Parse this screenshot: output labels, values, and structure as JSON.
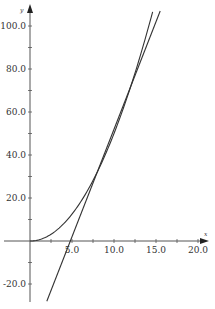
{
  "chart_data": {
    "type": "line",
    "title": "",
    "xlabel": "x",
    "ylabel": "y",
    "xlim": [
      -3.5,
      21.5
    ],
    "ylim": [
      -31,
      110
    ],
    "grid": false,
    "legend": "none",
    "x_ticks": [
      5.0,
      10.0,
      15.0,
      20.0
    ],
    "x_tick_labels": [
      "5.0",
      "10.0",
      "15.0",
      "20.0"
    ],
    "y_ticks": [
      -20.0,
      20.0,
      40.0,
      60.0,
      80.0,
      100.0
    ],
    "y_tick_labels": [
      "-20.0",
      "20.0",
      "40.0",
      "60.0",
      "80.0",
      "100.0"
    ],
    "series": [
      {
        "name": "curve",
        "expression": "y = x^2/2",
        "x": [
          0,
          2,
          4,
          6,
          8,
          10,
          12,
          14,
          14.6
        ],
        "values": [
          0,
          2,
          8,
          18,
          32,
          50,
          72,
          98,
          106.6
        ],
        "color": "#333333"
      },
      {
        "name": "line",
        "expression": "y = 10x - 48",
        "x": [
          2.0,
          4.8,
          8,
          12,
          15.5
        ],
        "values": [
          -28,
          0,
          32,
          72,
          107
        ],
        "color": "#333333"
      }
    ]
  },
  "axes": {
    "x_label": "x",
    "y_label": "y"
  }
}
